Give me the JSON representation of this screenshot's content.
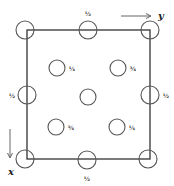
{
  "diagram": {
    "title": "",
    "axes": {
      "y": {
        "label": "y",
        "direction": "right"
      },
      "x": {
        "label": "x",
        "direction": "down"
      }
    },
    "unit_cell": {
      "shape": "square"
    },
    "atoms": [
      {
        "id": "corner-top-left",
        "height_label": ""
      },
      {
        "id": "corner-top-right",
        "height_label": ""
      },
      {
        "id": "corner-bottom-left",
        "height_label": ""
      },
      {
        "id": "corner-bottom-right",
        "height_label": ""
      },
      {
        "id": "edge-top-mid",
        "height_label": "½"
      },
      {
        "id": "edge-left-mid",
        "height_label": "½"
      },
      {
        "id": "edge-right-mid",
        "height_label": "½"
      },
      {
        "id": "edge-bottom-mid",
        "height_label": "½"
      },
      {
        "id": "center",
        "height_label": ""
      },
      {
        "id": "inner-upper-left",
        "height_label": "¼"
      },
      {
        "id": "inner-upper-right",
        "height_label": "¾"
      },
      {
        "id": "inner-lower-left",
        "height_label": "¾"
      },
      {
        "id": "inner-lower-right",
        "height_label": "¼"
      }
    ]
  }
}
